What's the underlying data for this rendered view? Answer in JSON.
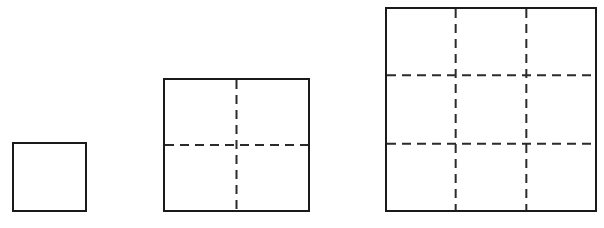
{
  "figure": {
    "background_color": "#ffffff",
    "stroke_color": "#1a1a1a",
    "dash_color": "#2b2b2b",
    "canvas": {
      "width": 604,
      "height": 228
    },
    "baseline_y": 212,
    "squares": [
      {
        "name": "square-1",
        "label": "1",
        "divisions": 1,
        "cells": 1,
        "x": 12,
        "y": 142,
        "width": 75,
        "height": 70,
        "border_width": 2,
        "dash_pattern": "8 5",
        "dash_width": 2
      },
      {
        "name": "square-2",
        "label": "2",
        "divisions": 2,
        "cells": 4,
        "x": 163,
        "y": 78,
        "width": 147,
        "height": 134,
        "border_width": 2,
        "dash_pattern": "9 6",
        "dash_width": 2
      },
      {
        "name": "square-3",
        "label": "3",
        "divisions": 3,
        "cells": 9,
        "x": 385,
        "y": 7,
        "width": 212,
        "height": 205,
        "border_width": 2,
        "dash_pattern": "9 6",
        "dash_width": 2
      }
    ]
  },
  "chart_data": {
    "type": "diagram",
    "categories": [
      "1",
      "2",
      "3"
    ],
    "values": [
      1,
      4,
      9
    ],
    "xlabel": "",
    "ylabel": "",
    "annotations": [
      "Square of side 1 contains 1 unit cell, no interior dashed lines",
      "Square of side 2 contains 4 unit cells, 1 horizontal and 1 vertical dashed line",
      "Square of side 3 contains 9 unit cells, 2 horizontal and 2 vertical dashed lines"
    ],
    "grid": true,
    "legend": "none"
  }
}
